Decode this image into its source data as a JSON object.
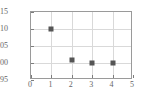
{
  "chart_data": {
    "type": "scatter",
    "title": "",
    "subtitle": "",
    "xlabel": "",
    "ylabel": "",
    "x": [
      1,
      2,
      3,
      4
    ],
    "values": [
      5.1,
      5.01,
      5.0,
      5.0
    ],
    "points": [
      {
        "x": 1,
        "y": 5.1
      },
      {
        "x": 2,
        "y": 5.01
      },
      {
        "x": 3,
        "y": 5.0
      },
      {
        "x": 4,
        "y": 5.0
      }
    ],
    "xlim": [
      0,
      5
    ],
    "ylim": [
      4.95,
      5.15
    ],
    "xticks": [
      0,
      1,
      2,
      3,
      4,
      5
    ],
    "yticks": [
      4.95,
      5.0,
      5.05,
      5.1,
      5.15
    ],
    "xtick_labels": [
      "0",
      "1",
      "2",
      "3",
      "4",
      "5"
    ],
    "ytick_labels": [
      "4.95",
      "5.00",
      "5.05",
      "5.10",
      "5.15"
    ],
    "grid": true,
    "grid_color": "#d9d9d9",
    "legend": null,
    "marker_shape": "square",
    "marker_color": "#555555",
    "frame_color": "#9a9a9a",
    "tick_label_color": "#666666",
    "background": "#ffffff"
  }
}
